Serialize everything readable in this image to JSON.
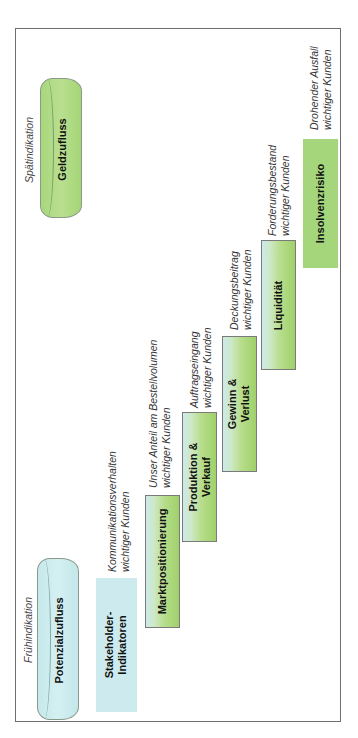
{
  "diagram": {
    "stage_labels": {
      "early": "Frühindikation",
      "late": "Spätindikation"
    },
    "cylinders": {
      "start": {
        "label": "Potenzialzufluss",
        "color": "#cdebef"
      },
      "end": {
        "label": "Geldzufluss",
        "color": "#a6d67b"
      }
    },
    "steps": [
      {
        "label_line1": "Stakeholder-",
        "label_line2": "Indikatoren",
        "note_line1": "Kommunikationsverhalten",
        "note_line2": "wichtiger Kunden"
      },
      {
        "label_line1": "Marktpositionierung",
        "label_line2": "",
        "note_line1": "Unser Anteil am Bestellvolumen",
        "note_line2": "wichtiger Kunden"
      },
      {
        "label_line1": "Produktion &",
        "label_line2": "Verkauf",
        "note_line1": "Auftragseingang",
        "note_line2": "wichtiger Kunden"
      },
      {
        "label_line1": "Gewinn &",
        "label_line2": "Verlust",
        "note_line1": "Deckungsbeitrag",
        "note_line2": "wichtiger Kunden"
      },
      {
        "label_line1": "Liquidität",
        "label_line2": "",
        "note_line1": "Forderungsbestand",
        "note_line2": "wichtiger Kunden"
      },
      {
        "label_line1": "Insolvenzrisiko",
        "label_line2": "",
        "note_line1": "Drohender Ausfall",
        "note_line2": "wichtiger Kunden"
      }
    ],
    "colors": {
      "green": "#a6d67b",
      "cyan": "#cdebef",
      "border": "#7a7a7a"
    }
  }
}
